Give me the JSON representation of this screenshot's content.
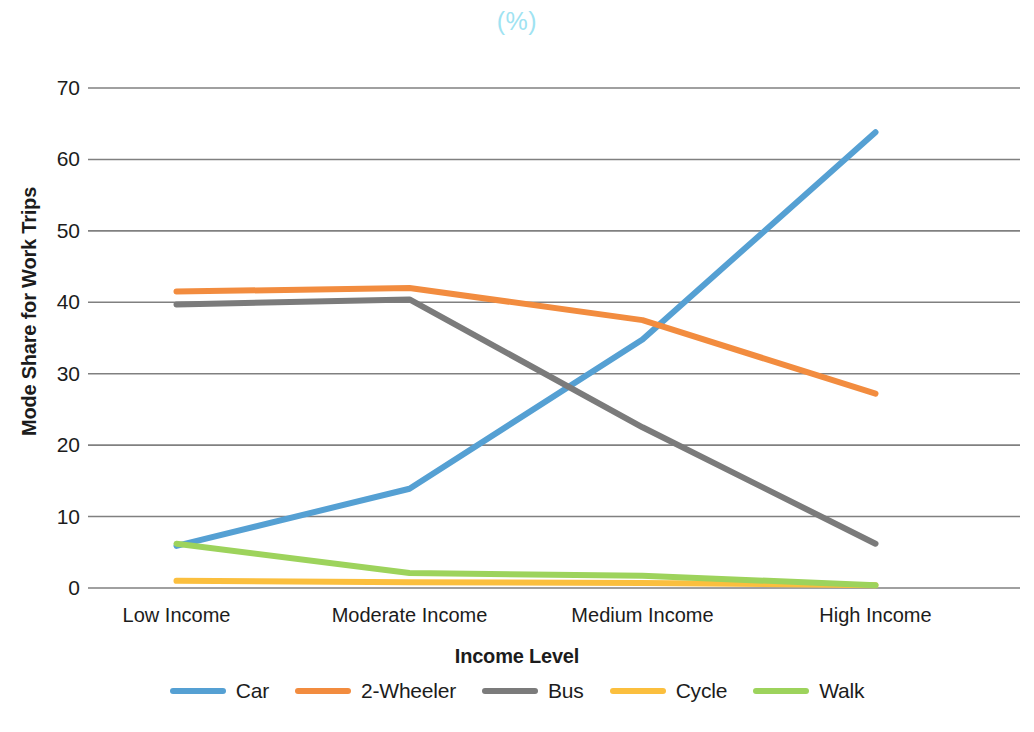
{
  "chart_data": {
    "type": "line",
    "title": "(%)",
    "xlabel": "Income Level",
    "ylabel": "Mode Share for Work Trips",
    "categories": [
      "Low Income",
      "Moderate Income",
      "Medium Income",
      "High Income"
    ],
    "yticks": [
      70,
      60,
      50,
      40,
      30,
      20,
      10,
      0
    ],
    "ylim": [
      0,
      70
    ],
    "grid": true,
    "legend_position": "bottom",
    "series": [
      {
        "name": "Car",
        "color": "#55A0D3",
        "values": [
          5.9,
          13.9,
          34.8,
          63.8
        ]
      },
      {
        "name": "2-Wheeler",
        "color": "#F28C3F",
        "values": [
          41.5,
          42.0,
          37.5,
          27.2
        ]
      },
      {
        "name": "Bus",
        "color": "#7B7B7B",
        "values": [
          39.7,
          40.4,
          22.5,
          6.2
        ]
      },
      {
        "name": "Cycle",
        "color": "#FBBF3E",
        "values": [
          1.0,
          0.8,
          0.7,
          0.4
        ]
      },
      {
        "name": "Walk",
        "color": "#9DD košice",
        "values": [
          6.2,
          2.1,
          1.7,
          0.4
        ]
      }
    ]
  },
  "axis": {
    "title_text": "(%)",
    "title_color": "#9fe3f2",
    "y_title": "Mode Share for Work Trips",
    "x_title": "Income Level",
    "y_tick_labels": [
      "70",
      "60",
      "50",
      "40",
      "30",
      "20",
      "10",
      "0"
    ],
    "x_tick_labels": [
      "Low Income",
      "Moderate Income",
      "Medium Income",
      "High Income"
    ],
    "gridline_color": "#808080"
  },
  "legend": {
    "items": [
      {
        "label": "Car",
        "color": "#55A0D3"
      },
      {
        "label": "2-Wheeler",
        "color": "#F28C3F"
      },
      {
        "label": "Bus",
        "color": "#7B7B7B"
      },
      {
        "label": "Cycle",
        "color": "#FBBF3E"
      },
      {
        "label": "Walk",
        "color": "#9DD35C"
      }
    ]
  }
}
